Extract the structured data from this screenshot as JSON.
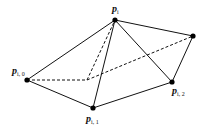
{
  "diagram": {
    "type": "polyhedron-star",
    "colors": {
      "edge": "#111111",
      "vertex": "#000000",
      "background": "#ffffff"
    },
    "vertices": [
      {
        "id": "p_i",
        "label": "p",
        "subscript": "i",
        "x": 115,
        "y": 20,
        "lx": 112,
        "ly": 12
      },
      {
        "id": "p_i0",
        "label": "p",
        "subscript": "i, 0",
        "x": 27,
        "y": 80,
        "lx": 12,
        "ly": 74
      },
      {
        "id": "p_i1",
        "label": "p",
        "subscript": "i, 1",
        "x": 93,
        "y": 108,
        "lx": 86,
        "ly": 122
      },
      {
        "id": "p_i2",
        "label": "p",
        "subscript": "i, 2",
        "x": 172,
        "y": 82,
        "lx": 172,
        "ly": 94
      },
      {
        "id": "top_right",
        "label": "",
        "subscript": "",
        "x": 193,
        "y": 36
      },
      {
        "id": "hidden",
        "label": "",
        "subscript": "",
        "x": 87,
        "y": 80,
        "hidden": true
      }
    ],
    "edges_solid": [
      [
        "p_i",
        "p_i0"
      ],
      [
        "p_i",
        "p_i1"
      ],
      [
        "p_i",
        "p_i2"
      ],
      [
        "p_i",
        "top_right"
      ],
      [
        "top_right",
        "p_i2"
      ],
      [
        "p_i0",
        "p_i1"
      ],
      [
        "p_i1",
        "p_i2"
      ]
    ],
    "edges_dashed": [
      [
        "p_i0",
        "hidden"
      ],
      [
        "hidden",
        "p_i"
      ],
      [
        "hidden",
        "top_right"
      ]
    ]
  }
}
